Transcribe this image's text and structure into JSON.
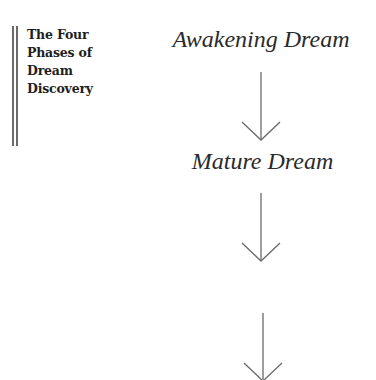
{
  "sidebar": {
    "title_lines": [
      "The Four",
      "Phases of",
      "Dream",
      "Discovery"
    ]
  },
  "diagram": {
    "phases": [
      {
        "label": "Awakening Dream"
      },
      {
        "label": "Mature Dream"
      }
    ],
    "arrow_icon": "down-arrow-icon",
    "arrow_color": "#6a6a6a"
  }
}
